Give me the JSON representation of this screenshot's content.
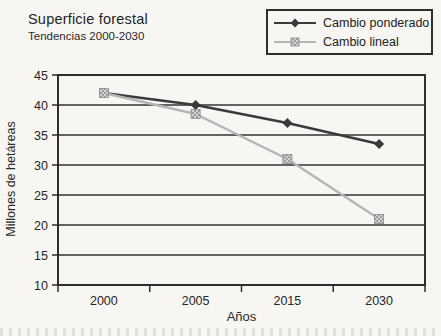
{
  "header": {
    "title": "Superficie forestal",
    "subtitle": "Tendencias 2000-2030"
  },
  "chart_data": {
    "type": "line",
    "title": "Superficie forestal",
    "subtitle": "Tendencias 2000-2030",
    "categories": [
      "2000",
      "2005",
      "2015",
      "2030"
    ],
    "series": [
      {
        "name": "Cambio ponderado",
        "values": [
          42,
          40,
          37,
          33.5
        ],
        "color": "#3a3a3a",
        "marker": "diamond"
      },
      {
        "name": "Cambio lineal",
        "values": [
          42,
          38.5,
          31,
          21
        ],
        "color": "#b5b5b5",
        "marker": "square"
      }
    ],
    "xlabel": "Años",
    "ylabel": "Millones de hetáreas",
    "ylim": [
      10,
      45
    ],
    "yticks": [
      45,
      40,
      35,
      30,
      25,
      20,
      15,
      10
    ],
    "grid": true,
    "legend_position": "top-right"
  },
  "style": {
    "axis_color": "#2e2e2e",
    "grid_color": "#333333",
    "tick_label_color": "#262626",
    "paper_color": "#f7f6f2",
    "marker_square_fill_light": "#d2d2d2",
    "marker_square_fill_dark": "#9c9c9c",
    "marker_square_stroke": "#8a8a8a"
  }
}
